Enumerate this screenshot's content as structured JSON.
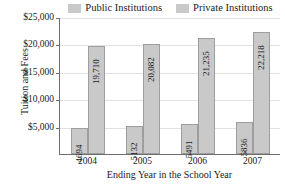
{
  "chart_data": {
    "type": "bar",
    "title": "",
    "xlabel": "Ending Year in the School Year",
    "ylabel": "Tuition and Fees",
    "categories": [
      "2004",
      "2005",
      "2006",
      "2007"
    ],
    "series": [
      {
        "name": "Public Institutions",
        "values": [
          4694,
          5132,
          5491,
          5836
        ],
        "labels": [
          "4694",
          "5132",
          "5491",
          "5836"
        ],
        "color": "#c9c9c9"
      },
      {
        "name": "Private Institutions",
        "values": [
          19710,
          20082,
          21235,
          22218
        ],
        "labels": [
          "19,710",
          "20,082",
          "21,235",
          "22,218"
        ],
        "color": "#c9c9c9"
      }
    ],
    "ylim": [
      0,
      25000
    ],
    "yticks": [
      5000,
      10000,
      15000,
      20000,
      25000
    ],
    "ytick_labels": [
      "$5,000",
      "$10,000",
      "$15,000",
      "$20,000",
      "$25,000"
    ],
    "grid": true,
    "legend_position": "top"
  },
  "legend": {
    "entries": [
      {
        "label": "Public Institutions"
      },
      {
        "label": "Private Institutions"
      }
    ]
  }
}
